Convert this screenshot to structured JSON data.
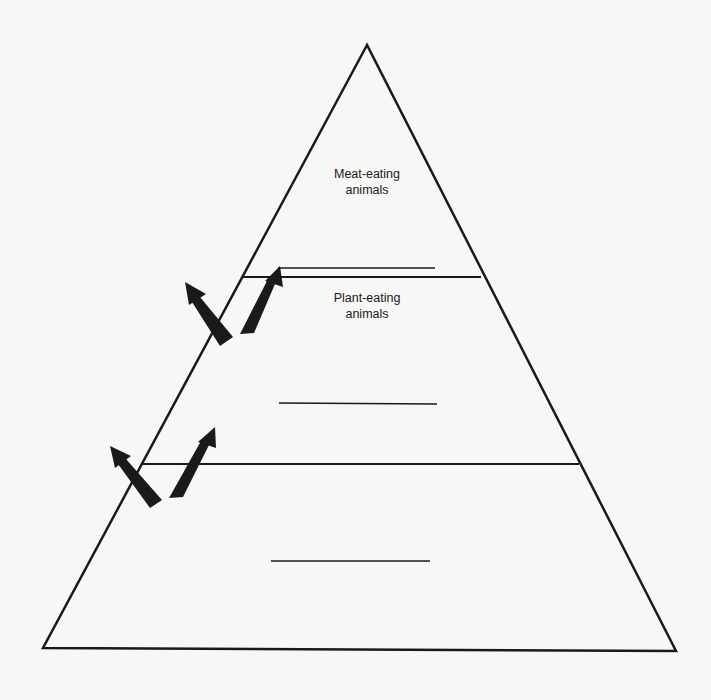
{
  "diagram": {
    "type": "energy-pyramid",
    "colors": {
      "stroke": "#1a1a1a",
      "background": "#f7f7f5"
    },
    "levels": [
      {
        "position": "top",
        "label_line1": "Meat-eating",
        "label_line2": "animals",
        "blank_answer_line": true
      },
      {
        "position": "middle",
        "label_line1": "Plant-eating",
        "label_line2": "animals",
        "blank_answer_line": true
      },
      {
        "position": "bottom",
        "label_line1": "",
        "label_line2": "",
        "blank_answer_line": true
      }
    ],
    "arrows": [
      {
        "between": "middle-top",
        "direction": "up-left",
        "meaning": "energy lost"
      },
      {
        "between": "middle-top",
        "direction": "up-right",
        "meaning": "energy passed up"
      },
      {
        "between": "bottom-middle",
        "direction": "up-left",
        "meaning": "energy lost"
      },
      {
        "between": "bottom-middle",
        "direction": "up-right",
        "meaning": "energy passed up"
      }
    ]
  }
}
